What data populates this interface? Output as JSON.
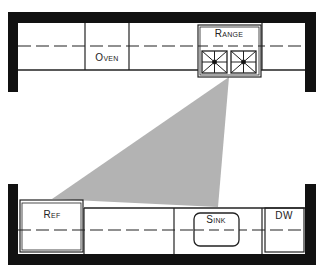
{
  "diagram": {
    "type": "kitchen-floor-plan",
    "colors": {
      "wall": "#111111",
      "line": "#222222",
      "work_triangle": "#b3b3b3",
      "background": "#ffffff"
    },
    "top_counter": {
      "appliances": [
        {
          "id": "oven",
          "label": "Oven"
        },
        {
          "id": "range",
          "label": "Range",
          "burners": 2
        }
      ]
    },
    "bottom_counter": {
      "appliances": [
        {
          "id": "ref",
          "label": "Ref"
        },
        {
          "id": "sink",
          "label": "Sink"
        },
        {
          "id": "dw",
          "label": "DW"
        }
      ]
    },
    "work_triangle": {
      "vertices": [
        "range",
        "ref",
        "sink"
      ]
    }
  }
}
